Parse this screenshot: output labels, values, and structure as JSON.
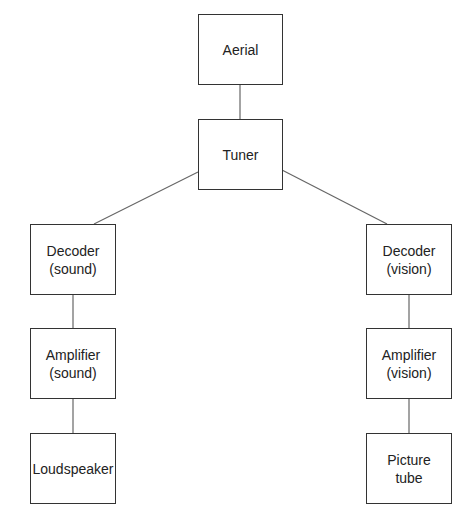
{
  "diagram": {
    "type": "block-diagram",
    "nodes": {
      "aerial": {
        "line1": "Aerial",
        "line2": ""
      },
      "tuner": {
        "line1": "Tuner",
        "line2": ""
      },
      "decoder_sound": {
        "line1": "Decoder",
        "line2": "(sound)"
      },
      "amplifier_sound": {
        "line1": "Amplifier",
        "line2": "(sound)"
      },
      "loudspeaker": {
        "line1": "Loudspeaker",
        "line2": ""
      },
      "decoder_vision": {
        "line1": "Decoder",
        "line2": "(vision)"
      },
      "amplifier_vision": {
        "line1": "Amplifier",
        "line2": "(vision)"
      },
      "picture_tube": {
        "line1": "Picture",
        "line2": "tube"
      }
    },
    "edges": [
      [
        "Aerial",
        "Tuner"
      ],
      [
        "Tuner",
        "Decoder (sound)"
      ],
      [
        "Tuner",
        "Decoder (vision)"
      ],
      [
        "Decoder (sound)",
        "Amplifier (sound)"
      ],
      [
        "Amplifier (sound)",
        "Loudspeaker"
      ],
      [
        "Decoder (vision)",
        "Amplifier (vision)"
      ],
      [
        "Amplifier (vision)",
        "Picture tube"
      ]
    ],
    "colors": {
      "stroke": "#333333",
      "line": "#666666",
      "background": "#ffffff"
    }
  }
}
